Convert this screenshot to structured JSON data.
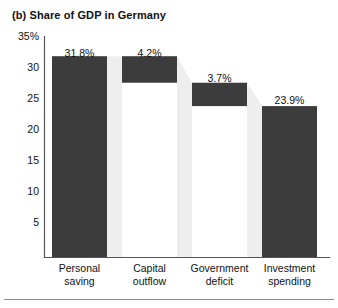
{
  "figure": {
    "title": "(b) Share of GDP in Germany",
    "background_color": "#ffffff",
    "bar_color": "#3c3c3c",
    "connector_color": "#eeeeee",
    "axis_color": "#555555"
  },
  "chart_data": {
    "type": "bar",
    "chart_style": "waterfall",
    "title": "(b) Share of GDP in Germany",
    "xlabel": "",
    "ylabel": "",
    "ylim": [
      0,
      35
    ],
    "grid": false,
    "legend": "none",
    "categories": [
      "Personal saving",
      "Capital outflow",
      "Government deficit",
      "Investment spending"
    ],
    "category_lines": [
      [
        "Personal",
        "saving"
      ],
      [
        "Capital",
        "outflow"
      ],
      [
        "Government",
        "deficit"
      ],
      [
        "Investment",
        "spending"
      ]
    ],
    "values": [
      31.8,
      4.2,
      3.7,
      23.9
    ],
    "data_labels": [
      "31.8%",
      "4.2%",
      "3.7%",
      "23.9%"
    ],
    "bar_bases": [
      0,
      27.6,
      23.9,
      0
    ],
    "bar_tops": [
      31.8,
      31.8,
      27.6,
      23.9
    ],
    "bar_kinds": [
      "total",
      "decrease",
      "decrease",
      "total"
    ],
    "yticks": [
      35,
      30,
      25,
      20,
      15,
      10,
      5
    ],
    "ytick_labels": [
      "35%",
      "30",
      "25",
      "20",
      "15",
      "10",
      "5"
    ]
  }
}
